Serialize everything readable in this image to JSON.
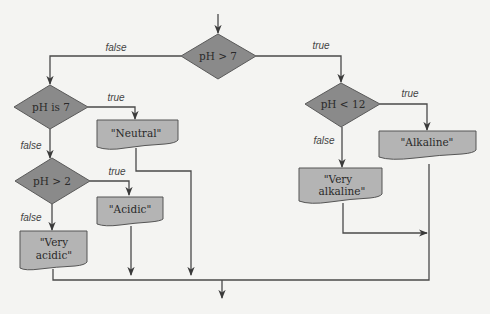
{
  "diagram": {
    "type": "flowchart",
    "decisions": {
      "ph_gt_7": "pH > 7",
      "ph_is_7": "pH is 7",
      "ph_gt_2": "pH > 2",
      "ph_lt_12": "pH < 12"
    },
    "outputs": {
      "neutral": "\"Neutral\"",
      "acidic": "\"Acidic\"",
      "very_acidic_1": "\"Very",
      "very_acidic_2": "acidic\"",
      "alkaline": "\"Alkaline\"",
      "very_alkaline_1": "\"Very",
      "very_alkaline_2": "alkaline\""
    },
    "edge_labels": {
      "true": "true",
      "false": "false"
    },
    "edges": [
      {
        "from": "pH > 7",
        "to": "pH < 12",
        "label": "true"
      },
      {
        "from": "pH > 7",
        "to": "pH is 7",
        "label": "false"
      },
      {
        "from": "pH is 7",
        "to": "\"Neutral\"",
        "label": "true"
      },
      {
        "from": "pH is 7",
        "to": "pH > 2",
        "label": "false"
      },
      {
        "from": "pH > 2",
        "to": "\"Acidic\"",
        "label": "true"
      },
      {
        "from": "pH > 2",
        "to": "\"Very acidic\"",
        "label": "false"
      },
      {
        "from": "pH < 12",
        "to": "\"Alkaline\"",
        "label": "true"
      },
      {
        "from": "pH < 12",
        "to": "\"Very alkaline\"",
        "label": "false"
      }
    ],
    "colors": {
      "decision_fill": "#8a8a8a",
      "output_fill": "#b4b4b4",
      "line": "#4a4a4a",
      "background": "#f4f4f2"
    }
  }
}
